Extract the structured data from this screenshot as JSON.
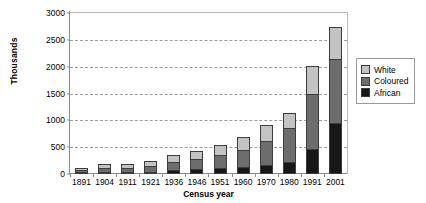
{
  "chart_data": {
    "type": "bar",
    "subtype": "stacked-column",
    "title": "",
    "xlabel": "Census year",
    "ylabel": "Thousands",
    "ylim": [
      0,
      3000
    ],
    "ytick_step": 500,
    "yticks": [
      3000,
      2500,
      2000,
      1500,
      1000,
      500,
      0
    ],
    "grid": true,
    "grid_style": "dashed-horizontal",
    "legend_position": "right",
    "categories": [
      "1891",
      "1904",
      "1911",
      "1921",
      "1936",
      "1946",
      "1951",
      "1960",
      "1970",
      "1980",
      "1991",
      "2001"
    ],
    "stack_order_bottom_to_top": [
      "African",
      "Coloured",
      "White"
    ],
    "series": [
      {
        "name": "African",
        "color": "#171717",
        "values": [
          10,
          25,
          30,
          40,
          70,
          95,
          115,
          135,
          175,
          230,
          470,
          950
        ]
      },
      {
        "name": "Coloured",
        "color": "#6d6d6d",
        "values": [
          40,
          75,
          80,
          105,
          145,
          190,
          240,
          310,
          445,
          635,
          1025,
          1200
        ]
      },
      {
        "name": "White",
        "color": "#c3c3c3",
        "values": [
          30,
          80,
          65,
          90,
          135,
          150,
          195,
          250,
          290,
          265,
          520,
          585
        ]
      }
    ],
    "totals": [
      80,
      180,
      175,
      235,
      350,
      435,
      550,
      695,
      910,
      1130,
      2015,
      2735
    ]
  },
  "legend": {
    "items": [
      {
        "label": "White",
        "color": "#c3c3c3"
      },
      {
        "label": "Coloured",
        "color": "#6d6d6d"
      },
      {
        "label": "African",
        "color": "#171717"
      }
    ]
  },
  "colors": {
    "axis": "#8a8a8a",
    "grid": "#9d9d9d",
    "frame": "#b9b9b9",
    "text": "#000000",
    "background": "#ffffff"
  }
}
